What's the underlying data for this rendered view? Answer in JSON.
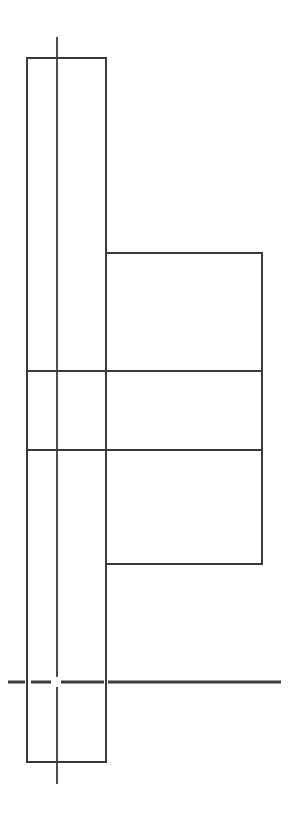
{
  "drawing": {
    "width": 296,
    "height": 826,
    "stroke_color": "#3a3a3a",
    "background": "#ffffff",
    "shaft_rect": {
      "x": 27,
      "y": 58,
      "w": 79,
      "h": 704
    },
    "flange_rect": {
      "x": 106,
      "y": 253,
      "w": 156,
      "h": 311
    },
    "section_lines": [
      {
        "x1": 27,
        "y1": 371,
        "x2": 262,
        "y2": 371
      },
      {
        "x1": 27,
        "y1": 450,
        "x2": 262,
        "y2": 450
      }
    ],
    "centerline": {
      "x": 57,
      "y1": 37,
      "y2": 784
    },
    "ground_line": {
      "y": 682,
      "x1": 8,
      "x2": 281
    }
  }
}
